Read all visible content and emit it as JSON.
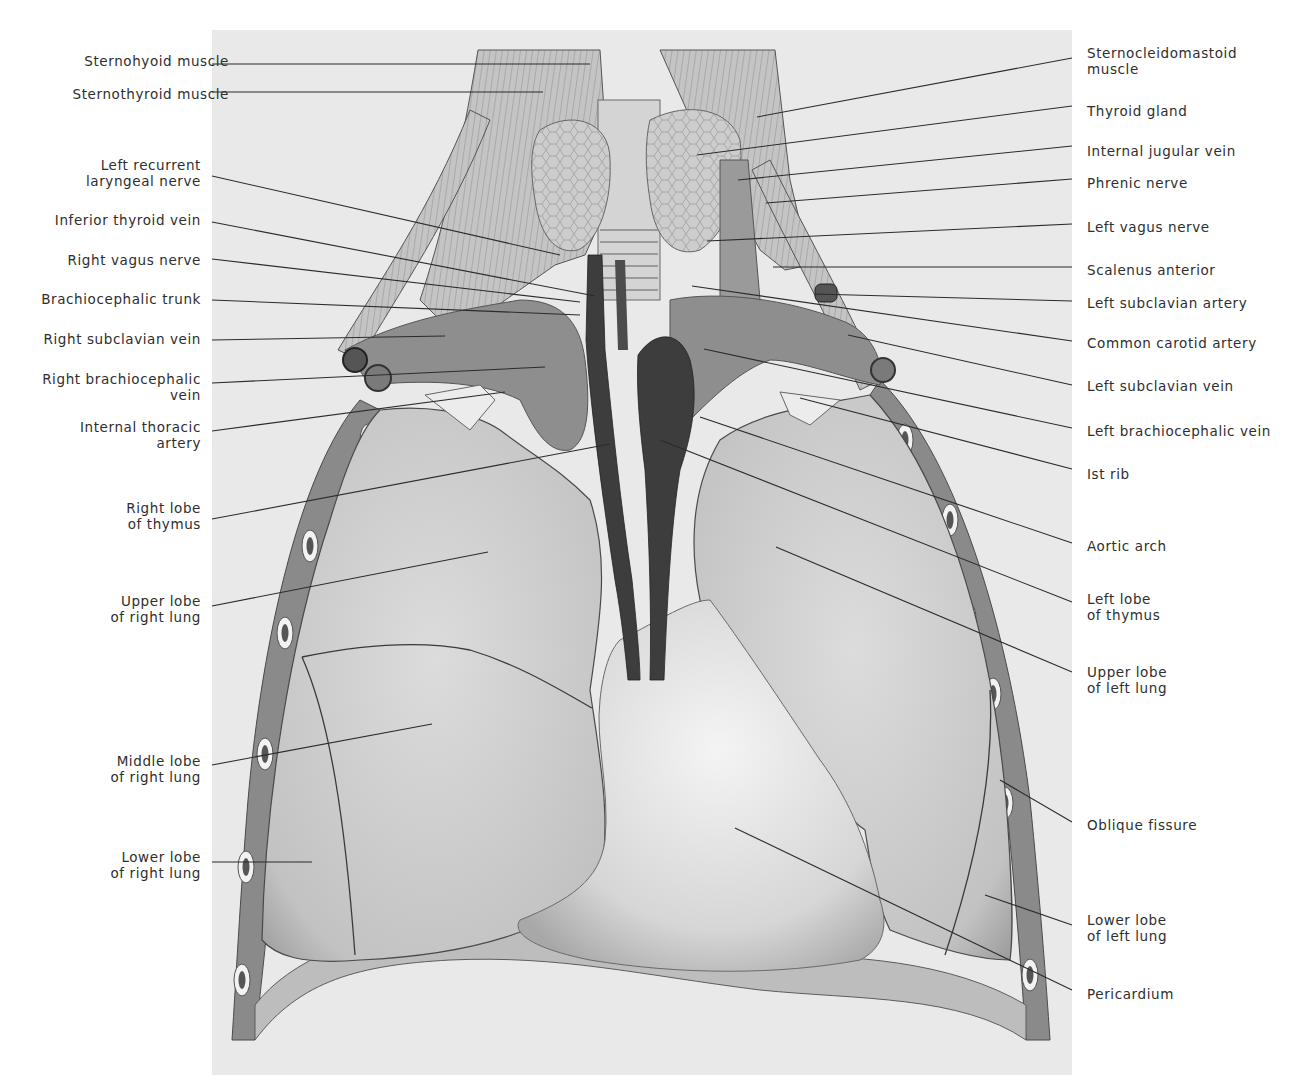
{
  "figure": {
    "panel": {
      "x": 212,
      "y": 30,
      "width": 860,
      "height": 1045,
      "fill": "#e9e9e9"
    },
    "colors": {
      "background": "#ffffff",
      "panel": "#e9e9e9",
      "lung": "#cfcfcf",
      "lung_shade": "#a9a9a9",
      "heart": "#dedede",
      "vessel_dark": "#3a3a3a",
      "vein": "#8c8c8c",
      "muscle": "#b8b8b8",
      "thyroid": "#c7c7c7",
      "rib_wall": "#777777",
      "leader": "#2b2b2b",
      "text": "#2e2e2e"
    }
  },
  "labels_left": [
    {
      "id": "sternohyoid-muscle",
      "text": "Sternohyoid muscle",
      "x": 229,
      "y": 53,
      "leader": [
        212,
        64,
        590,
        64
      ]
    },
    {
      "id": "sternothyroid-muscle",
      "text": "Sternothyroid muscle",
      "x": 229,
      "y": 86,
      "leader": [
        212,
        92,
        543,
        92
      ]
    },
    {
      "id": "left-recurrent-laryngeal-nerve",
      "text": "Left recurrent\nlaryngeal nerve",
      "x": 201,
      "y": 157,
      "leader": [
        212,
        176,
        560,
        255
      ]
    },
    {
      "id": "inferior-thyroid-vein",
      "text": "Inferior thyroid vein",
      "x": 201,
      "y": 212,
      "leader": [
        212,
        222,
        595,
        296
      ]
    },
    {
      "id": "right-vagus-nerve",
      "text": "Right vagus nerve",
      "x": 201,
      "y": 252,
      "leader": [
        212,
        259,
        580,
        302
      ]
    },
    {
      "id": "brachiocephalic-trunk",
      "text": "Brachiocephalic trunk",
      "x": 201,
      "y": 291,
      "leader": [
        212,
        300,
        580,
        315
      ]
    },
    {
      "id": "right-subclavian-vein",
      "text": "Right subclavian vein",
      "x": 201,
      "y": 331,
      "leader": [
        212,
        340,
        445,
        336
      ]
    },
    {
      "id": "right-brachiocephalic-vein",
      "text": "Right brachiocephalic\nvein",
      "x": 201,
      "y": 371,
      "leader": [
        212,
        383,
        545,
        367
      ]
    },
    {
      "id": "internal-thoracic-artery",
      "text": "Internal thoracic\nartery",
      "x": 201,
      "y": 419,
      "leader": [
        212,
        431,
        505,
        392
      ]
    },
    {
      "id": "right-lobe-of-thymus",
      "text": "Right lobe\nof thymus",
      "x": 201,
      "y": 500,
      "leader": [
        212,
        519,
        610,
        444
      ]
    },
    {
      "id": "upper-lobe-of-right-lung",
      "text": "Upper lobe\nof right lung",
      "x": 201,
      "y": 593,
      "leader": [
        212,
        606,
        488,
        552
      ]
    },
    {
      "id": "middle-lobe-of-right-lung",
      "text": "Middle lobe\nof right lung",
      "x": 201,
      "y": 753,
      "leader": [
        212,
        765,
        432,
        724
      ]
    },
    {
      "id": "lower-lobe-of-right-lung",
      "text": "Lower lobe\nof right lung",
      "x": 201,
      "y": 849,
      "leader": [
        212,
        862,
        312,
        862
      ]
    }
  ],
  "labels_right": [
    {
      "id": "sternocleidomastoid-muscle",
      "text": "Sternocleidomastoid\nmuscle",
      "x": 1087,
      "y": 45,
      "leader": [
        1072,
        58,
        757,
        117
      ]
    },
    {
      "id": "thyroid-gland",
      "text": "Thyroid gland",
      "x": 1087,
      "y": 103,
      "leader": [
        1072,
        106,
        697,
        155
      ]
    },
    {
      "id": "internal-jugular-vein",
      "text": "Internal jugular vein",
      "x": 1087,
      "y": 143,
      "leader": [
        1072,
        146,
        738,
        180
      ]
    },
    {
      "id": "phrenic-nerve",
      "text": "Phrenic nerve",
      "x": 1087,
      "y": 175,
      "leader": [
        1072,
        179,
        766,
        203
      ]
    },
    {
      "id": "left-vagus-nerve",
      "text": "Left vagus nerve",
      "x": 1087,
      "y": 219,
      "leader": [
        1072,
        224,
        707,
        241
      ]
    },
    {
      "id": "scalenus-anterior",
      "text": "Scalenus anterior",
      "x": 1087,
      "y": 262,
      "leader": [
        1072,
        267,
        773,
        267
      ]
    },
    {
      "id": "left-subclavian-artery",
      "text": "Left subclavian artery",
      "x": 1087,
      "y": 295,
      "leader": [
        1072,
        301,
        815,
        294
      ]
    },
    {
      "id": "common-carotid-artery",
      "text": "Common carotid artery",
      "x": 1087,
      "y": 335,
      "leader": [
        1072,
        341,
        692,
        286
      ]
    },
    {
      "id": "left-subclavian-vein",
      "text": "Left subclavian vein",
      "x": 1087,
      "y": 378,
      "leader": [
        1072,
        385,
        848,
        335
      ]
    },
    {
      "id": "left-brachiocephalic-vein",
      "text": "Left brachiocephalic vein",
      "x": 1087,
      "y": 423,
      "leader": [
        1072,
        428,
        704,
        349
      ]
    },
    {
      "id": "1st-rib",
      "text": "Ist rib",
      "x": 1087,
      "y": 466,
      "leader": [
        1072,
        469,
        800,
        398
      ]
    },
    {
      "id": "aortic-arch",
      "text": "Aortic arch",
      "x": 1087,
      "y": 538,
      "leader": [
        1072,
        543,
        700,
        417
      ]
    },
    {
      "id": "left-lobe-of-thymus",
      "text": "Left lobe\nof thymus",
      "x": 1087,
      "y": 591,
      "leader": [
        1072,
        602,
        660,
        440
      ]
    },
    {
      "id": "upper-lobe-of-left-lung",
      "text": "Upper lobe\nof left lung",
      "x": 1087,
      "y": 664,
      "leader": [
        1072,
        672,
        776,
        547
      ]
    },
    {
      "id": "oblique-fissure",
      "text": "Oblique fissure",
      "x": 1087,
      "y": 817,
      "leader": [
        1072,
        822,
        1000,
        780
      ]
    },
    {
      "id": "lower-lobe-of-left-lung",
      "text": "Lower lobe\nof left lung",
      "x": 1087,
      "y": 912,
      "leader": [
        1072,
        925,
        985,
        895
      ]
    },
    {
      "id": "pericardium",
      "text": "Pericardium",
      "x": 1087,
      "y": 986,
      "leader": [
        1072,
        990,
        735,
        828
      ]
    }
  ]
}
